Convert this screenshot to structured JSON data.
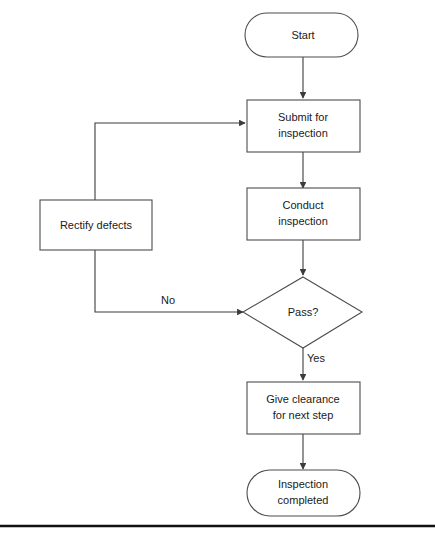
{
  "diagram": {
    "background_color": "#ffffff",
    "stroke_color": "#4d4d4d",
    "text_color": "#1a1a1a",
    "nodes": {
      "start": {
        "label": "Start",
        "shape": "terminator"
      },
      "submit": {
        "label_line1": "Submit for",
        "label_line2": "inspection",
        "shape": "process"
      },
      "conduct": {
        "label_line1": "Conduct",
        "label_line2": "inspection",
        "shape": "process"
      },
      "rectify": {
        "label": "Rectify defects",
        "shape": "process"
      },
      "decision": {
        "label": "Pass?",
        "shape": "decision"
      },
      "clearance": {
        "label_line1": "Give clearance",
        "label_line2": "for next step",
        "shape": "process"
      },
      "completed": {
        "label_line1": "Inspection",
        "label_line2": "completed",
        "shape": "terminator"
      }
    },
    "edge_labels": {
      "no": "No",
      "yes": "Yes"
    }
  }
}
